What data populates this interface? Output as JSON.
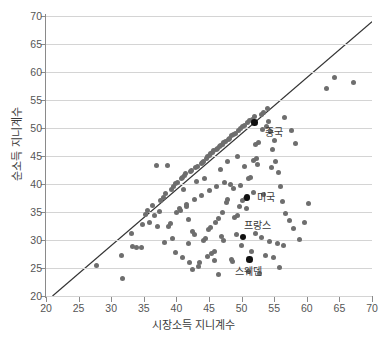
{
  "chart_data": {
    "type": "scatter",
    "title": "",
    "xlabel": "시장소득 지니계수",
    "ylabel": "순소득 지니계수",
    "xlim": [
      20,
      70
    ],
    "ylim": [
      20,
      70
    ],
    "xticks": [
      20,
      25,
      30,
      35,
      40,
      45,
      50,
      55,
      60,
      65,
      70
    ],
    "yticks": [
      20,
      25,
      30,
      35,
      40,
      45,
      50,
      55,
      60,
      65,
      70
    ],
    "grid": "horizontal",
    "legend": "none",
    "reference_line": {
      "name": "y-equals-x-line",
      "from": [
        21,
        20
      ],
      "to": [
        70,
        69
      ],
      "color": "#333333"
    },
    "point_color": "#6e6e6e",
    "highlight_color": "#111111",
    "points": [
      [
        27.8,
        25.5
      ],
      [
        31.8,
        23.1
      ],
      [
        31.6,
        27.3
      ],
      [
        33.1,
        31.1
      ],
      [
        33.3,
        28.8
      ],
      [
        33.9,
        28.7
      ],
      [
        34.6,
        28.7
      ],
      [
        35.3,
        34.5
      ],
      [
        35.6,
        35.2
      ],
      [
        36.3,
        36.1
      ],
      [
        36.9,
        43.3
      ],
      [
        38.7,
        43.3
      ],
      [
        37.1,
        32.5
      ],
      [
        37.6,
        37.0
      ],
      [
        38.0,
        37.6
      ],
      [
        38.4,
        38.3
      ],
      [
        38.8,
        32.4
      ],
      [
        39.1,
        33.0
      ],
      [
        39.3,
        39.0
      ],
      [
        39.6,
        39.5
      ],
      [
        39.9,
        40.1
      ],
      [
        40.2,
        40.3
      ],
      [
        40.0,
        34.9
      ],
      [
        40.6,
        35.3
      ],
      [
        40.8,
        40.9
      ],
      [
        41.0,
        41.2
      ],
      [
        41.2,
        41.5
      ],
      [
        41.4,
        41.8
      ],
      [
        41.5,
        36.0
      ],
      [
        41.8,
        33.7
      ],
      [
        41.9,
        29.4
      ],
      [
        42.1,
        42.2
      ],
      [
        42.3,
        42.4
      ],
      [
        42.5,
        31.5
      ],
      [
        42.7,
        31.0
      ],
      [
        42.4,
        24.8
      ],
      [
        43.0,
        42.9
      ],
      [
        43.2,
        43.2
      ],
      [
        43.4,
        25.3
      ],
      [
        43.6,
        25.9
      ],
      [
        43.8,
        43.6
      ],
      [
        44.0,
        43.9
      ],
      [
        44.2,
        44.1
      ],
      [
        44.1,
        29.9
      ],
      [
        44.4,
        30.3
      ],
      [
        44.6,
        44.6
      ],
      [
        44.8,
        44.9
      ],
      [
        45.0,
        45.1
      ],
      [
        44.9,
        31.8
      ],
      [
        45.2,
        32.2
      ],
      [
        45.3,
        45.4
      ],
      [
        45.5,
        45.6
      ],
      [
        45.7,
        45.9
      ],
      [
        45.4,
        27.6
      ],
      [
        45.9,
        28.0
      ],
      [
        46.1,
        46.2
      ],
      [
        46.3,
        46.4
      ],
      [
        46.0,
        33.2
      ],
      [
        46.5,
        33.8
      ],
      [
        46.6,
        46.7
      ],
      [
        46.8,
        46.9
      ],
      [
        47.0,
        47.1
      ],
      [
        46.9,
        30.6
      ],
      [
        47.2,
        30.0
      ],
      [
        47.3,
        47.4
      ],
      [
        47.5,
        47.6
      ],
      [
        47.7,
        36.7
      ],
      [
        47.9,
        37.2
      ],
      [
        48.0,
        48.0
      ],
      [
        48.2,
        48.2
      ],
      [
        48.4,
        26.6
      ],
      [
        48.6,
        26.2
      ],
      [
        48.5,
        48.6
      ],
      [
        48.8,
        48.9
      ],
      [
        49.0,
        49.1
      ],
      [
        48.9,
        34.1
      ],
      [
        49.3,
        34.4
      ],
      [
        49.5,
        49.6
      ],
      [
        49.8,
        49.9
      ],
      [
        49.2,
        30.9
      ],
      [
        50.1,
        50.2
      ],
      [
        50.4,
        50.5
      ],
      [
        50.2,
        37.0
      ],
      [
        50.6,
        37.4
      ],
      [
        50.9,
        51.0
      ],
      [
        51.2,
        51.3
      ],
      [
        51.0,
        40.9
      ],
      [
        51.4,
        41.2
      ],
      [
        51.7,
        51.6
      ],
      [
        52.0,
        52.0
      ],
      [
        51.9,
        44.2
      ],
      [
        52.3,
        44.5
      ],
      [
        52.1,
        47.0
      ],
      [
        52.6,
        47.4
      ],
      [
        53.0,
        52.4
      ],
      [
        53.4,
        52.8
      ],
      [
        53.2,
        49.8
      ],
      [
        53.8,
        50.2
      ],
      [
        54.0,
        53.4
      ],
      [
        54.5,
        49.4
      ],
      [
        54.8,
        46.2
      ],
      [
        55.2,
        44.0
      ],
      [
        55.6,
        42.1
      ],
      [
        55.9,
        39.5
      ],
      [
        56.2,
        36.8
      ],
      [
        56.8,
        34.8
      ],
      [
        57.3,
        33.4
      ],
      [
        57.9,
        32.0
      ],
      [
        52.2,
        31.2
      ],
      [
        53.1,
        30.4
      ],
      [
        54.3,
        29.8
      ],
      [
        55.5,
        29.3
      ],
      [
        56.4,
        29.0
      ],
      [
        51.5,
        28.0
      ],
      [
        53.6,
        27.2
      ],
      [
        54.9,
        26.8
      ],
      [
        55.8,
        25.1
      ],
      [
        58.9,
        30.1
      ],
      [
        59.6,
        33.2
      ],
      [
        60.2,
        36.6
      ],
      [
        51.1,
        24.4
      ],
      [
        52.8,
        24.0
      ],
      [
        50.8,
        35.6
      ],
      [
        49.7,
        35.9
      ],
      [
        48.3,
        40.0
      ],
      [
        47.4,
        40.3
      ],
      [
        46.2,
        39.6
      ],
      [
        45.1,
        38.8
      ],
      [
        43.9,
        38.0
      ],
      [
        42.8,
        37.3
      ],
      [
        41.6,
        36.4
      ],
      [
        40.4,
        35.7
      ],
      [
        39.4,
        30.2
      ],
      [
        38.2,
        29.6
      ],
      [
        37.4,
        35.1
      ],
      [
        36.6,
        34.3
      ],
      [
        35.9,
        33.2
      ],
      [
        34.8,
        32.8
      ],
      [
        44.7,
        27.1
      ],
      [
        45.8,
        26.4
      ],
      [
        42.0,
        26.0
      ],
      [
        40.9,
        26.9
      ],
      [
        39.8,
        27.8
      ],
      [
        48.7,
        39.2
      ],
      [
        49.9,
        39.8
      ],
      [
        51.8,
        38.4
      ],
      [
        53.3,
        38.1
      ],
      [
        54.6,
        43.0
      ],
      [
        55.0,
        47.8
      ],
      [
        52.5,
        43.4
      ],
      [
        50.5,
        43.1
      ],
      [
        44.3,
        41.0
      ],
      [
        43.1,
        40.5
      ],
      [
        41.1,
        39.1
      ],
      [
        47.8,
        44.0
      ],
      [
        46.7,
        42.6
      ],
      [
        63.0,
        57.0
      ],
      [
        64.2,
        59.0
      ],
      [
        67.2,
        58.2
      ],
      [
        57.6,
        49.6
      ],
      [
        56.6,
        51.8
      ],
      [
        58.2,
        47.2
      ],
      [
        54.2,
        51.2
      ],
      [
        49.4,
        45.0
      ],
      [
        47.1,
        34.9
      ],
      [
        46.4,
        23.9
      ],
      [
        50.0,
        29.0
      ]
    ],
    "highlighted_points": [
      {
        "name": "중국",
        "x": 52.0,
        "y": 51.0,
        "label_dx": 10,
        "label_dy": 11
      },
      {
        "name": "미국",
        "x": 50.8,
        "y": 37.6,
        "label_dx": 10,
        "label_dy": 1
      },
      {
        "name": "프랑스",
        "x": 50.2,
        "y": 30.5,
        "label_dx": 1,
        "label_dy": -11
      },
      {
        "name": "스웨덴",
        "x": 51.2,
        "y": 26.5,
        "label_dx": -14,
        "label_dy": 12
      }
    ]
  }
}
